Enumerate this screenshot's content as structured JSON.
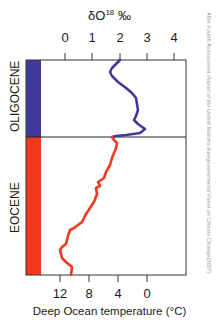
{
  "chart_data": {
    "type": "line",
    "title": "δO18 ‰",
    "title_parts": {
      "base": "δO",
      "sup": "18",
      "unit": " ‰"
    },
    "top_axis": {
      "label": "δO18 ‰",
      "ticks": [
        "0",
        "1",
        "2",
        "3",
        "4"
      ],
      "range": [
        0,
        4
      ]
    },
    "bottom_axis": {
      "label": "Deep Ocean temperature (°C)",
      "ticks": [
        "12",
        "8",
        "4",
        "0"
      ],
      "range": [
        12,
        0
      ]
    },
    "periods": [
      {
        "name": "OLIGOCENE",
        "color": "#3d3a9a"
      },
      {
        "name": "EOCENE",
        "color": "#f03a1e"
      }
    ],
    "series": [
      {
        "name": "Oligocene δO18",
        "color": "#3d3a9a",
        "points_px": [
          [
            120,
            60
          ],
          [
            116,
            64
          ],
          [
            112,
            68
          ],
          [
            110,
            72
          ],
          [
            112,
            76
          ],
          [
            118,
            82
          ],
          [
            126,
            88
          ],
          [
            132,
            93
          ],
          [
            136,
            98
          ],
          [
            137,
            104
          ],
          [
            138,
            110
          ],
          [
            136,
            116
          ],
          [
            134,
            120
          ],
          [
            138,
            124
          ],
          [
            145,
            129
          ],
          [
            140,
            133
          ],
          [
            126,
            135
          ],
          [
            116,
            136
          ],
          [
            112,
            137
          ]
        ],
        "approx_dO18": [
          2.0,
          1.7,
          1.6,
          1.6,
          1.9,
          2.2,
          2.6,
          2.7,
          2.5,
          2.9,
          2.0
        ]
      },
      {
        "name": "Eocene δO18",
        "color": "#f03a1e",
        "points_px": [
          [
            112,
            137
          ],
          [
            114,
            140
          ],
          [
            117,
            143
          ],
          [
            116,
            148
          ],
          [
            112,
            158
          ],
          [
            110,
            165
          ],
          [
            106,
            172
          ],
          [
            104,
            178
          ],
          [
            98,
            182
          ],
          [
            100,
            186
          ],
          [
            96,
            188
          ],
          [
            97,
            194
          ],
          [
            94,
            202
          ],
          [
            90,
            208
          ],
          [
            86,
            214
          ],
          [
            82,
            222
          ],
          [
            74,
            228
          ],
          [
            70,
            230
          ],
          [
            68,
            236
          ],
          [
            66,
            244
          ],
          [
            62,
            247
          ],
          [
            60,
            250
          ],
          [
            62,
            258
          ],
          [
            66,
            262
          ],
          [
            72,
            267
          ],
          [
            71,
            275
          ]
        ],
        "approx_dO18": [
          1.6,
          1.8,
          1.5,
          1.2,
          1.0,
          0.8,
          0.3,
          0.1,
          0.0,
          0.3
        ]
      }
    ],
    "grid": false,
    "legend": "none"
  },
  "credit": "After Fourth Assessment Report of the United Nations Intergovernmental Panel on Climate Change(2007)"
}
